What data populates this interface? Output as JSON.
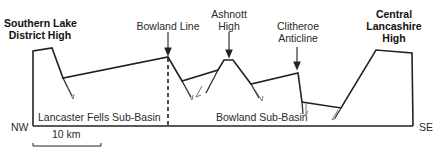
{
  "diagram": {
    "type": "geological-cross-section",
    "highs": {
      "southern_lake": {
        "line1": "Southern Lake",
        "line2": "District High"
      },
      "central_lancashire": {
        "line1": "Central",
        "line2": "Lancashire",
        "line3": "High"
      }
    },
    "features": {
      "bowland_line": "Bowland Line",
      "ashnott": {
        "line1": "Ashnott",
        "line2": "High"
      },
      "clitheroe": {
        "line1": "Clitheroe",
        "line2": "Anticline"
      }
    },
    "basins": {
      "lancaster_fells": "Lancaster Fells Sub-Basin",
      "bowland": "Bowland Sub-Basin"
    },
    "orientation": {
      "left": "NW",
      "right": "SE"
    },
    "scale_bar": {
      "label": "10 km"
    },
    "colors": {
      "line": "#222222",
      "background": "#ffffff"
    }
  }
}
